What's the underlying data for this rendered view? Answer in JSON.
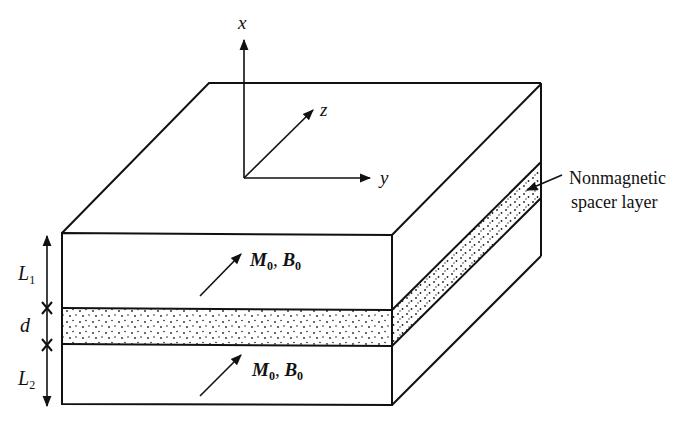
{
  "figure": {
    "type": "diagram",
    "axes": {
      "x_label": "x",
      "y_label": "y",
      "z_label": "z"
    },
    "dimensions": {
      "top_layer": "L",
      "top_layer_sub": "1",
      "spacer": "d",
      "bottom_layer": "L",
      "bottom_layer_sub": "2"
    },
    "layer_labels": {
      "top": {
        "m": "M",
        "m_sub": "0",
        "sep": ", ",
        "b": "B",
        "b_sub": "0"
      },
      "bottom": {
        "m": "M",
        "m_sub": "0",
        "sep": ", ",
        "b": "B",
        "b_sub": "0"
      }
    },
    "annotation": {
      "line1": "Nonmagnetic",
      "line2": "spacer layer"
    },
    "colors": {
      "ink": "#111111",
      "background": "#ffffff"
    }
  }
}
